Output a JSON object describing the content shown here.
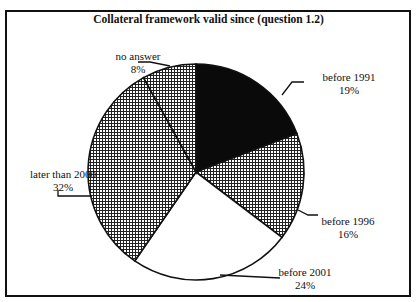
{
  "chart_data": {
    "type": "pie",
    "title": "Collateral framework valid since (question 1.2)",
    "slices": [
      {
        "label": "before 1991",
        "value": 19,
        "pct_label": "19%",
        "fill": "solid-black"
      },
      {
        "label": "before 1996",
        "value": 16,
        "pct_label": "16%",
        "fill": "crosshatch"
      },
      {
        "label": "before 2001",
        "value": 24,
        "pct_label": "24%",
        "fill": "white"
      },
      {
        "label": "later than 2000",
        "value": 32,
        "pct_label": "32%",
        "fill": "crosshatch"
      },
      {
        "label": "no answer",
        "value": 8,
        "pct_label": "8%",
        "fill": "crosshatch"
      }
    ],
    "start": "12 o'clock",
    "direction": "clockwise",
    "legend": "none (callout labels)"
  }
}
